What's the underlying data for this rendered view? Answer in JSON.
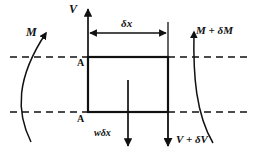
{
  "figure": {
    "type": "engineering-free-body-diagram",
    "colors": {
      "stroke": "#111111",
      "dashed": "#111111",
      "background": "#ffffff"
    }
  },
  "labels": {
    "shear_left": "V",
    "element_length": "δx",
    "moment_left": "M",
    "moment_right": "M + δM",
    "section_top": "A",
    "section_bottom": "A",
    "distributed_load": "wδx",
    "shear_right": "V + δV"
  },
  "geometry": {
    "element_box": {
      "x": 88,
      "y": 57,
      "width": 80,
      "height": 55
    },
    "neutral_axis_top_y": 57,
    "neutral_axis_bottom_y": 112,
    "dashed_line_x_start": 10,
    "dashed_line_x_end": 248
  }
}
